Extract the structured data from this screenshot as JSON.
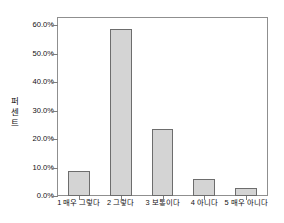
{
  "chart_data": {
    "type": "bar",
    "title": "",
    "subtitle": "",
    "xlabel": "",
    "ylabel": "퍼센트",
    "categories": [
      "1 매우 그렇다",
      "2 그렇다",
      "3 보통이다",
      "4 아니다",
      "5 매우 아니다"
    ],
    "values": [
      8.8,
      58.8,
      23.5,
      5.9,
      2.9
    ],
    "ylim": [
      0,
      62.5
    ],
    "ytick_values": [
      0,
      10,
      20,
      30,
      40,
      50,
      60
    ],
    "ytick_labels": [
      "0.0%",
      "10.0%",
      "20.0%",
      "30.0%",
      "40.0%",
      "50.0%",
      "60.0%"
    ],
    "grid": false,
    "legend": null,
    "legend_position": "none",
    "bar_fill_color": "#d4d4d4",
    "bar_border_color": "#6d6d6d",
    "axis_color": "#8f8f8f",
    "background_color": "#ffffff"
  }
}
